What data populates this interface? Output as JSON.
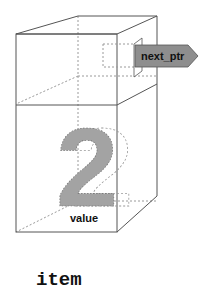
{
  "diagram": {
    "title": "item",
    "pointer_field": {
      "label": "next_ptr",
      "color": "#8e8e8e"
    },
    "value_field": {
      "label": "value",
      "digit": "2",
      "color": "#a3a3a3"
    },
    "line_color": "#555555",
    "dotted_color": "#9a9a9a"
  }
}
